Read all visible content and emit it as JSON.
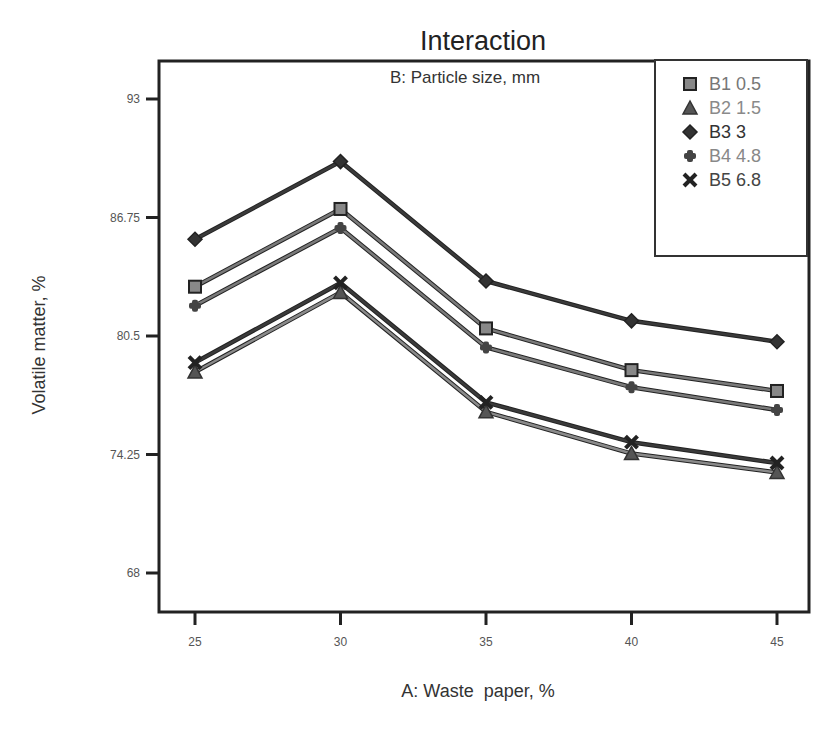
{
  "chart_data": {
    "type": "line",
    "title": "Interaction",
    "subtitle": "B: Particle size, mm",
    "xlabel": "A: Waste  paper, %",
    "ylabel": "Volatile matter, %",
    "x": [
      25,
      30,
      35,
      40,
      45
    ],
    "x_ticks": [
      "25",
      "30",
      "35",
      "40",
      "45"
    ],
    "y_ticks": [
      "93",
      "86.75",
      "80.5",
      "74.25",
      "68"
    ],
    "ylim": [
      66,
      95
    ],
    "grid": false,
    "legend_position": "top-right",
    "series": [
      {
        "name": "B1 0.5",
        "marker": "square",
        "color": "#777777",
        "values": [
          83.1,
          87.2,
          80.9,
          78.7,
          77.6
        ]
      },
      {
        "name": "B2 1.5",
        "marker": "triangle",
        "color": "#888888",
        "values": [
          78.6,
          82.8,
          76.5,
          74.3,
          73.3
        ]
      },
      {
        "name": "B3 3",
        "marker": "diamond",
        "color": "#333333",
        "values": [
          85.6,
          89.7,
          83.4,
          81.3,
          80.2
        ]
      },
      {
        "name": "B4 4.8",
        "marker": "plus",
        "color": "#777777",
        "values": [
          82.1,
          86.2,
          79.9,
          77.8,
          76.6
        ]
      },
      {
        "name": "B5 6.8",
        "marker": "x",
        "color": "#333333",
        "values": [
          79.1,
          83.3,
          77.0,
          74.9,
          73.8
        ]
      }
    ]
  }
}
